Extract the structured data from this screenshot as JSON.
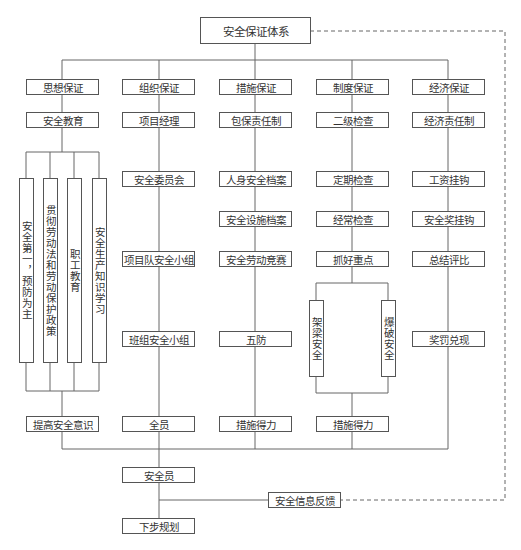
{
  "diagram": {
    "title": "安全保证体系",
    "columns": [
      {
        "header": "思想保证",
        "items": [
          "安全教育"
        ],
        "vertical_items": [
          "安全第一，预防为主",
          "贯彻劳动法和劳动保护政策",
          "职工教育",
          "安全生产知识学习"
        ],
        "outcome": "提高安全意识"
      },
      {
        "header": "组织保证",
        "items": [
          "项目经理",
          "安全委员会",
          "项目队安全小组",
          "班组安全小组"
        ],
        "outcome": "全员"
      },
      {
        "header": "措施保证",
        "items": [
          "包保责任制",
          "人身安全档案",
          "安全设施档案",
          "安全劳动竞赛",
          "五防"
        ],
        "outcome": "措施得力"
      },
      {
        "header": "制度保证",
        "items": [
          "二级检查",
          "定期检查",
          "经常检查",
          "抓好重点"
        ],
        "vertical_items": [
          "架梁安全",
          "爆破安全"
        ],
        "outcome": "措施得力"
      },
      {
        "header": "经济保证",
        "items": [
          "经济责任制",
          "工资挂钩",
          "安全奖挂钩",
          "总结评比",
          "奖罚兑现"
        ]
      }
    ],
    "safety_officer": "安全员",
    "feedback": "安全信息反馈",
    "next_step": "下步规划"
  }
}
